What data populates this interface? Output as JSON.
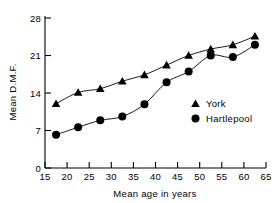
{
  "chart_data": {
    "type": "line",
    "title": "",
    "subtitle": "",
    "xlabel": "Mean age in years",
    "ylabel": "Mean D.M.F.",
    "xlim": [
      15,
      65
    ],
    "ylim": [
      0,
      28
    ],
    "xticks": [
      15,
      20,
      25,
      30,
      35,
      40,
      45,
      50,
      55,
      60,
      65
    ],
    "xticklabels": [
      "15",
      "20",
      "25",
      "30",
      "35",
      "40",
      "45",
      "50",
      "55",
      "60",
      "65"
    ],
    "yticks": [
      0,
      7,
      14,
      21,
      28
    ],
    "yticklabels": [
      "0",
      "7",
      "14",
      "21",
      "28"
    ],
    "grid": false,
    "legend_position": "center-right",
    "x": [
      17.5,
      22.5,
      27.5,
      32.5,
      37.5,
      42.5,
      47.5,
      52.5,
      57.5,
      62.5
    ],
    "series": [
      {
        "name": "York",
        "marker": "triangle",
        "color": "#000000",
        "values": [
          12.0,
          14.1,
          14.8,
          16.2,
          17.4,
          19.2,
          21.0,
          22.2,
          23.0,
          24.6
        ]
      },
      {
        "name": "Hartlepool",
        "marker": "circle",
        "color": "#000000",
        "values": [
          6.2,
          7.6,
          8.9,
          9.6,
          11.9,
          16.0,
          18.0,
          21.0,
          20.7,
          23.0
        ]
      }
    ]
  },
  "legend": {
    "entries": [
      {
        "label": "York",
        "marker": "triangle-marker-icon"
      },
      {
        "label": "Hartlepool",
        "marker": "circle-marker-icon"
      }
    ]
  },
  "colors": {
    "ink": "#000000",
    "background": "#ffffff"
  }
}
